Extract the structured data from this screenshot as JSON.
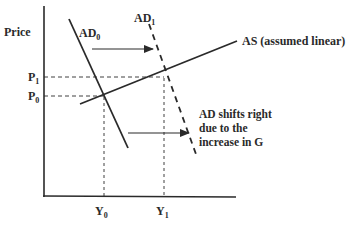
{
  "diagram": {
    "y_axis_label": "Price",
    "x_axis_label": "",
    "curves": {
      "ad0": {
        "label_main": "AD",
        "label_sub": "0"
      },
      "ad1": {
        "label_main": "AD",
        "label_sub": "1"
      },
      "as": {
        "label": "AS (assumed linear)"
      }
    },
    "price_levels": [
      {
        "label_main": "P",
        "label_sub": "1"
      },
      {
        "label_main": "P",
        "label_sub": "0"
      }
    ],
    "output_levels": [
      {
        "label_main": "Y",
        "label_sub": "0"
      },
      {
        "label_main": "Y",
        "label_sub": "1"
      }
    ],
    "annotation": {
      "lines": [
        "AD shifts right",
        "due to the",
        "increase in G"
      ]
    },
    "colors": {
      "line": "#2a2a2a",
      "background": "#ffffff"
    }
  }
}
